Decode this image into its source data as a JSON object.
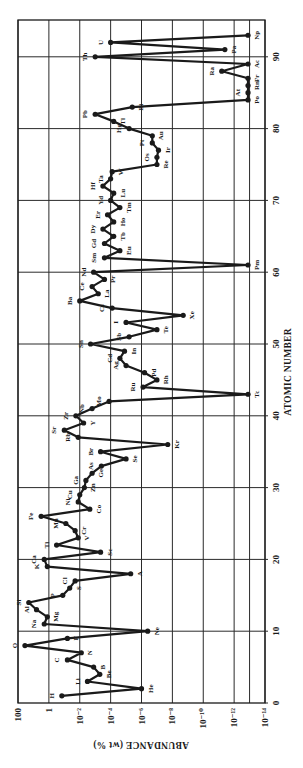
{
  "chart_data": {
    "type": "line",
    "orientation": "rotated -90 degrees (atomic number runs bottom-to-top, abundance runs left-to-right)",
    "title": "",
    "xlabel": "ATOMIC NUMBER",
    "ylabel": "ABUNDANCE (wt %)",
    "xlim": [
      0,
      95
    ],
    "ylim_log10": [
      2,
      -14
    ],
    "x_ticks": [
      0,
      10,
      20,
      30,
      40,
      50,
      60,
      70,
      80,
      90
    ],
    "y_ticks": [
      {
        "log10": 2,
        "label": "100"
      },
      {
        "log10": 0,
        "label": "1"
      },
      {
        "log10": -2,
        "label": "10⁻²"
      },
      {
        "log10": -4,
        "label": "10⁻⁴"
      },
      {
        "log10": -6,
        "label": "10⁻⁶"
      },
      {
        "log10": -8,
        "label": "10⁻⁸"
      },
      {
        "log10": -10,
        "label": "10⁻¹⁰"
      },
      {
        "log10": -12,
        "label": "10⁻¹²"
      },
      {
        "log10": -14,
        "label": "10⁻¹⁴"
      }
    ],
    "extra_gridline_log10": -13,
    "grid": true,
    "scale_y": "log",
    "series": [
      {
        "name": "Abundance of elements",
        "points": [
          {
            "z": 1,
            "el": "H",
            "log10": -0.84,
            "side": "L"
          },
          {
            "z": 2,
            "el": "He",
            "log10": -6.0,
            "side": "R"
          },
          {
            "z": 3,
            "el": "Li",
            "log10": -2.5,
            "side": "L"
          },
          {
            "z": 4,
            "el": "Be",
            "log10": -3.3,
            "side": "R"
          },
          {
            "z": 5,
            "el": "B",
            "log10": -2.9,
            "side": "R"
          },
          {
            "z": 6,
            "el": "C",
            "log10": -1.2,
            "side": "L"
          },
          {
            "z": 7,
            "el": "N",
            "log10": -2.1,
            "side": "R"
          },
          {
            "z": 8,
            "el": "O",
            "log10": 1.55,
            "side": "L"
          },
          {
            "z": 9,
            "el": "F",
            "log10": -1.2,
            "side": "R"
          },
          {
            "z": 10,
            "el": "Ne",
            "log10": -6.4,
            "side": "R"
          },
          {
            "z": 11,
            "el": "Na",
            "log10": 0.3,
            "side": "L"
          },
          {
            "z": 12,
            "el": "Mg",
            "log10": 0.1,
            "side": "R"
          },
          {
            "z": 13,
            "el": "Al",
            "log10": 0.8,
            "side": "L"
          },
          {
            "z": 14,
            "el": "Si",
            "log10": 1.3,
            "side": "L"
          },
          {
            "z": 15,
            "el": "P",
            "log10": -0.9,
            "side": "L"
          },
          {
            "z": 16,
            "el": "S",
            "log10": -1.35,
            "side": "R"
          },
          {
            "z": 17,
            "el": "Cl",
            "log10": -1.7,
            "side": "L"
          },
          {
            "z": 18,
            "el": "A",
            "log10": -5.3,
            "side": "R"
          },
          {
            "z": 19,
            "el": "K",
            "log10": 0.1,
            "side": "L"
          },
          {
            "z": 20,
            "el": "Ca",
            "log10": 0.3,
            "side": "L"
          },
          {
            "z": 21,
            "el": "Sc",
            "log10": -3.35,
            "side": "R"
          },
          {
            "z": 22,
            "el": "Ti",
            "log10": -0.5,
            "side": "L"
          },
          {
            "z": 23,
            "el": "V",
            "log10": -1.9,
            "side": "R"
          },
          {
            "z": 24,
            "el": "Cr",
            "log10": -1.7,
            "side": "R"
          },
          {
            "z": 25,
            "el": "Mn",
            "log10": -1.1,
            "side": "L"
          },
          {
            "z": 26,
            "el": "Fe",
            "log10": 0.5,
            "side": "L"
          },
          {
            "z": 27,
            "el": "Co",
            "log10": -2.65,
            "side": "R"
          },
          {
            "z": 28,
            "el": "Ni",
            "log10": -1.9,
            "side": "L"
          },
          {
            "z": 29,
            "el": "Cu",
            "log10": -2.0,
            "side": "L"
          },
          {
            "z": 30,
            "el": "Zn",
            "log10": -2.3,
            "side": "R"
          },
          {
            "z": 31,
            "el": "Ga",
            "log10": -2.4,
            "side": "L"
          },
          {
            "z": 32,
            "el": "Ge",
            "log10": -2.8,
            "side": "R"
          },
          {
            "z": 33,
            "el": "As",
            "log10": -3.4,
            "side": "L"
          },
          {
            "z": 34,
            "el": "Se",
            "log10": -5.0,
            "side": "R"
          },
          {
            "z": 35,
            "el": "Br",
            "log10": -3.35,
            "side": "L"
          },
          {
            "z": 36,
            "el": "Kr",
            "log10": -7.7,
            "side": "R"
          },
          {
            "z": 37,
            "el": "Rb",
            "log10": -1.9,
            "side": "L"
          },
          {
            "z": 38,
            "el": "Sr",
            "log10": -1.0,
            "side": "L"
          },
          {
            "z": 39,
            "el": "Y",
            "log10": -2.25,
            "side": "R"
          },
          {
            "z": 40,
            "el": "Zr",
            "log10": -1.75,
            "side": "L"
          },
          {
            "z": 41,
            "el": "Nb",
            "log10": -2.8,
            "side": "L"
          },
          {
            "z": 42,
            "el": "Mo",
            "log10": -3.9,
            "side": "L"
          },
          {
            "z": 43,
            "el": "Tc",
            "log10": -12.9,
            "side": "R"
          },
          {
            "z": 44,
            "el": "Ru",
            "log10": -6.1,
            "side": "L"
          },
          {
            "z": 45,
            "el": "Rh",
            "log10": -7.0,
            "side": "R"
          },
          {
            "z": 46,
            "el": "Pd",
            "log10": -6.2,
            "side": "R"
          },
          {
            "z": 47,
            "el": "Ag",
            "log10": -5.0,
            "side": "L"
          },
          {
            "z": 48,
            "el": "Cd",
            "log10": -4.6,
            "side": "L"
          },
          {
            "z": 49,
            "el": "In",
            "log10": -4.9,
            "side": "R"
          },
          {
            "z": 50,
            "el": "Sn",
            "log10": -2.7,
            "side": "L"
          },
          {
            "z": 51,
            "el": "Sb",
            "log10": -5.2,
            "side": "L"
          },
          {
            "z": 52,
            "el": "Te",
            "log10": -7.0,
            "side": "R"
          },
          {
            "z": 53,
            "el": "I",
            "log10": -5.0,
            "side": "L"
          },
          {
            "z": 54,
            "el": "Xe",
            "log10": -8.7,
            "side": "R"
          },
          {
            "z": 55,
            "el": "Cs",
            "log10": -4.1,
            "side": "L"
          },
          {
            "z": 56,
            "el": "Ba",
            "log10": -2.0,
            "side": "L"
          },
          {
            "z": 57,
            "el": "La",
            "log10": -3.2,
            "side": "R"
          },
          {
            "z": 58,
            "el": "Ce",
            "log10": -2.8,
            "side": "L"
          },
          {
            "z": 59,
            "el": "Pr",
            "log10": -3.6,
            "side": "R"
          },
          {
            "z": 60,
            "el": "Nd",
            "log10": -2.9,
            "side": "L"
          },
          {
            "z": 61,
            "el": "Pm",
            "log10": -12.9,
            "side": "R"
          },
          {
            "z": 62,
            "el": "Sm",
            "log10": -3.6,
            "side": "L"
          },
          {
            "z": 63,
            "el": "Eu",
            "log10": -4.6,
            "side": "R"
          },
          {
            "z": 64,
            "el": "Gd",
            "log10": -3.6,
            "side": "L"
          },
          {
            "z": 65,
            "el": "Tb",
            "log10": -4.2,
            "side": "R"
          },
          {
            "z": 66,
            "el": "Dy",
            "log10": -3.5,
            "side": "L"
          },
          {
            "z": 67,
            "el": "Ho",
            "log10": -4.2,
            "side": "R"
          },
          {
            "z": 68,
            "el": "Er",
            "log10": -3.8,
            "side": "L"
          },
          {
            "z": 69,
            "el": "Tm",
            "log10": -4.6,
            "side": "R"
          },
          {
            "z": 70,
            "el": "Yd",
            "log10": -4.0,
            "side": "L"
          },
          {
            "z": 71,
            "el": "Lu",
            "log10": -4.2,
            "side": "R"
          },
          {
            "z": 72,
            "el": "Hf",
            "log10": -3.5,
            "side": "L"
          },
          {
            "z": 73,
            "el": "Ta",
            "log10": -4.0,
            "side": "L"
          },
          {
            "z": 74,
            "el": "W",
            "log10": -4.1,
            "side": "R"
          },
          {
            "z": 75,
            "el": "Re",
            "log10": -7.0,
            "side": "R"
          },
          {
            "z": 76,
            "el": "Os",
            "log10": -7.0,
            "side": "L"
          },
          {
            "z": 77,
            "el": "Ir",
            "log10": -7.1,
            "side": "R"
          },
          {
            "z": 78,
            "el": "Pt",
            "log10": -6.7,
            "side": "L"
          },
          {
            "z": 79,
            "el": "Au",
            "log10": -6.7,
            "side": "R"
          },
          {
            "z": 80,
            "el": "Hg",
            "log10": -5.2,
            "side": "L"
          },
          {
            "z": 81,
            "el": "Tl",
            "log10": -4.2,
            "side": "R"
          },
          {
            "z": 82,
            "el": "Pb",
            "log10": -3.0,
            "side": "L"
          },
          {
            "z": 83,
            "el": "Bi",
            "log10": -5.4,
            "side": "R"
          },
          {
            "z": 84,
            "el": "Po",
            "log10": -12.9,
            "side": "R"
          },
          {
            "z": 85,
            "el": "At",
            "log10": -12.9,
            "side": "L"
          },
          {
            "z": 86,
            "el": "Rn",
            "log10": -12.9,
            "side": "R"
          },
          {
            "z": 87,
            "el": "Fr",
            "log10": -12.9,
            "side": "R"
          },
          {
            "z": 88,
            "el": "Ra",
            "log10": -11.2,
            "side": "L"
          },
          {
            "z": 89,
            "el": "Ac",
            "log10": -12.9,
            "side": "R"
          },
          {
            "z": 90,
            "el": "Th",
            "log10": -3.0,
            "side": "L"
          },
          {
            "z": 91,
            "el": "Pa",
            "log10": -11.4,
            "side": "R"
          },
          {
            "z": 92,
            "el": "U",
            "log10": -4.0,
            "side": "L"
          },
          {
            "z": 93,
            "el": "Np",
            "log10": -12.9,
            "side": "R"
          }
        ]
      }
    ]
  },
  "colors": {
    "ink": "#1a1a1a",
    "grid": "#2a2a2a",
    "background": "#ffffff"
  }
}
